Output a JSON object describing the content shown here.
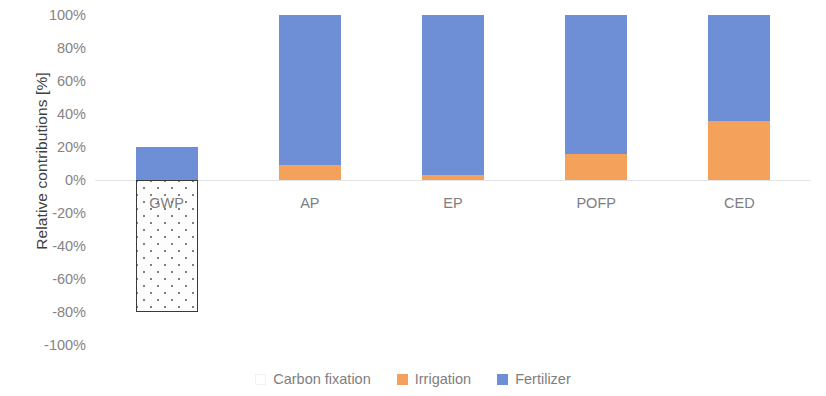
{
  "chart_data": {
    "type": "bar",
    "stacked": true,
    "title": "",
    "xlabel": "",
    "ylabel": "Relative contributions [%]",
    "ylim": [
      -100,
      100
    ],
    "ytick_labels": [
      "100%",
      "80%",
      "60%",
      "40%",
      "20%",
      "0%",
      "-20%",
      "-40%",
      "-60%",
      "-80%",
      "-100%"
    ],
    "ytick_values": [
      100,
      80,
      60,
      40,
      20,
      0,
      -20,
      -40,
      -60,
      -80,
      -100
    ],
    "grid": false,
    "zero_line": true,
    "legend_position": "bottom",
    "categories": [
      "GWP",
      "AP",
      "EP",
      "POFP",
      "CED"
    ],
    "series": [
      {
        "name": "Carbon fixation",
        "color": "#ffffff",
        "pattern": "dotted",
        "values": [
          -80,
          0,
          0,
          0,
          0
        ]
      },
      {
        "name": "Irrigation",
        "color": "#f4a15b",
        "values": [
          0,
          9,
          3,
          16,
          36
        ]
      },
      {
        "name": "Fertilizer",
        "color": "#6e8ed6",
        "values": [
          20,
          91,
          97,
          84,
          64
        ]
      }
    ]
  },
  "axis": {
    "y_title": "Relative contributions [%]"
  },
  "legend": {
    "items": [
      {
        "label": "Carbon fixation",
        "icon": "legend-swatch-carbon-fixation"
      },
      {
        "label": "Irrigation",
        "icon": "legend-swatch-irrigation"
      },
      {
        "label": "Fertilizer",
        "icon": "legend-swatch-fertilizer"
      }
    ]
  }
}
